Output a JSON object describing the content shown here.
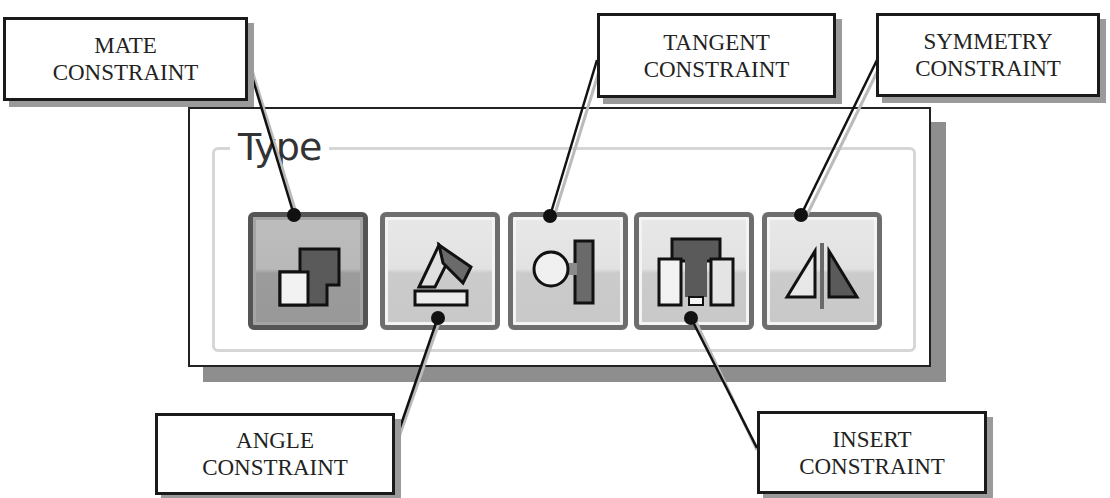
{
  "panel": {
    "group_title": "Type",
    "buttons": [
      {
        "id": "mate",
        "icon": "mate-constraint-icon",
        "state": "selected"
      },
      {
        "id": "angle",
        "icon": "angle-constraint-icon",
        "state": "normal"
      },
      {
        "id": "tangent",
        "icon": "tangent-constraint-icon",
        "state": "normal"
      },
      {
        "id": "insert",
        "icon": "insert-constraint-icon",
        "state": "normal"
      },
      {
        "id": "symmetry",
        "icon": "symmetry-constraint-icon",
        "state": "normal"
      }
    ]
  },
  "callouts": {
    "mate": {
      "line1": "MATE",
      "line2": "CONSTRAINT"
    },
    "tangent": {
      "line1": "TANGENT",
      "line2": "CONSTRAINT"
    },
    "symmetry": {
      "line1": "SYMMETRY",
      "line2": "CONSTRAINT"
    },
    "angle": {
      "line1": "ANGLE",
      "line2": "CONSTRAINT"
    },
    "insert": {
      "line1": "INSERT",
      "line2": "CONSTRAINT"
    }
  },
  "colors": {
    "icon_dark": "#5a5a5a",
    "icon_outline": "#111111",
    "button_border": "#6e6e6e",
    "shadow": "#8e8e8e"
  }
}
